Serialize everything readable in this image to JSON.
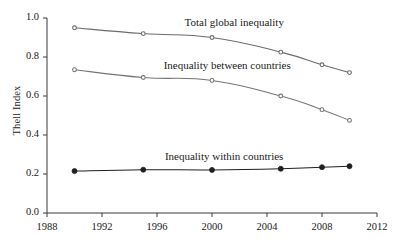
{
  "chart_data": {
    "type": "line",
    "title": "",
    "subtitle": "",
    "xlabel": "",
    "ylabel": "Thell Index",
    "xlim": [
      1988,
      2012
    ],
    "ylim": [
      0.0,
      1.0
    ],
    "grid": false,
    "legend_position": "inline-annotations",
    "x_ticks": [
      "1988",
      "1992",
      "1996",
      "2000",
      "2004",
      "2008",
      "2012"
    ],
    "x_tick_values": [
      1988,
      1992,
      1996,
      2000,
      2004,
      2008,
      2012
    ],
    "y_ticks": [
      "0.0",
      "0.2",
      "0.4",
      "0.6",
      "0.8",
      "1.0"
    ],
    "y_tick_values": [
      0.0,
      0.2,
      0.4,
      0.6,
      0.8,
      1.0
    ],
    "x": [
      1990,
      1995,
      2000,
      2005,
      2008,
      2010
    ],
    "series": [
      {
        "name": "Total global inequality",
        "values": [
          0.95,
          0.92,
          0.9,
          0.825,
          0.76,
          0.72
        ],
        "color": "#6b6b6b",
        "marker": "circle-open",
        "annotation": "Total global inequality"
      },
      {
        "name": "Inequality between countries",
        "values": [
          0.735,
          0.695,
          0.68,
          0.6,
          0.53,
          0.475
        ],
        "color": "#757575",
        "marker": "circle-open",
        "annotation": "Inequality between countries"
      },
      {
        "name": "Inequality within countries",
        "values": [
          0.215,
          0.222,
          0.221,
          0.227,
          0.235,
          0.24
        ],
        "color": "#202020",
        "marker": "circle-filled",
        "annotation": "Inequality within countries"
      }
    ],
    "annotations": [
      {
        "text": "Total global inequality",
        "x": 2001.6,
        "y": 0.975
      },
      {
        "text": "Inequality between countries",
        "x": 2001.1,
        "y": 0.755
      },
      {
        "text": "Inequality within countries",
        "x": 2000.9,
        "y": 0.285
      }
    ],
    "colors": {
      "axis": "#3a3a3a",
      "text": "#1a1a1a",
      "series_total": "#6b6b6b",
      "series_between": "#757575",
      "series_within": "#202020",
      "background": "#ffffff"
    }
  }
}
